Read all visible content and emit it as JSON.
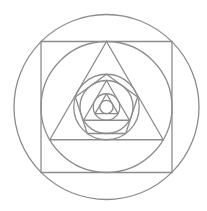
{
  "diagram": {
    "stroke_color": "#8c8c8c",
    "stroke_width": 1.3,
    "background": "#ffffff",
    "center": [
      106.5,
      107
    ],
    "shapes": [
      {
        "type": "circle",
        "name": "outer-circle",
        "r": 92.5
      },
      {
        "type": "polygon",
        "name": "square",
        "sides": 4,
        "circumradius": 92.6,
        "rotation_deg": 45
      },
      {
        "type": "circle",
        "name": "circle-in-square",
        "r": 65.5
      },
      {
        "type": "polygon",
        "name": "large-triangle",
        "sides": 3,
        "circumradius": 65.5,
        "rotation_deg": 0
      },
      {
        "type": "circle",
        "name": "circle-in-large-triangle",
        "r": 32.75
      },
      {
        "type": "polygon",
        "name": "pentagon",
        "sides": 5,
        "circumradius": 32.75,
        "rotation_deg": 0
      },
      {
        "type": "circle",
        "name": "circle-in-pentagon",
        "r": 26.5
      },
      {
        "type": "polygon",
        "name": "medium-triangle",
        "sides": 3,
        "circumradius": 26.5,
        "rotation_deg": 0
      },
      {
        "type": "circle",
        "name": "circle-in-medium-triangle",
        "r": 13.25
      },
      {
        "type": "polygon",
        "name": "small-triangle",
        "sides": 3,
        "circumradius": 13.25,
        "rotation_deg": 0
      },
      {
        "type": "circle",
        "name": "innermost-circle",
        "r": 6.6
      }
    ]
  }
}
